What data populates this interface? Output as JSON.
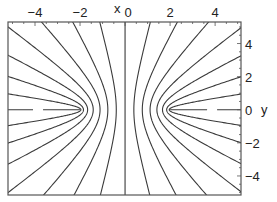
{
  "chart_data": {
    "type": "contour",
    "title": "",
    "xlabel": "x",
    "ylabel": "y",
    "xlim": [
      -5.2,
      5.15
    ],
    "ylim": [
      -5.15,
      5.3
    ],
    "xticks": [
      -4,
      -2,
      0,
      2,
      4
    ],
    "yticks": [
      -4,
      -2,
      0,
      2,
      4
    ],
    "xtick_labels": [
      "−4",
      "−2",
      "0",
      "2",
      "4"
    ],
    "ytick_labels": [
      "−4",
      "−2",
      "0",
      "2",
      "4"
    ],
    "x_axis_position": "top",
    "y_axis_position": "right",
    "grid": false,
    "legend": null,
    "focus_c": 2.0,
    "levels_v_over_pi": [
      0.0625,
      0.125,
      0.1875,
      0.25,
      0.3125,
      0.375,
      0.4375,
      0.5,
      0.5625,
      0.625,
      0.6875,
      0.75,
      0.8125,
      0.875,
      0.9375
    ],
    "dashed_segments": [
      {
        "y": 0,
        "x_from": -5.2,
        "x_to": -2.0
      },
      {
        "y": 0,
        "x_from": 2.0,
        "x_to": 5.15
      }
    ],
    "line_color": "#3a3a3a",
    "frame_color": "#555555"
  }
}
